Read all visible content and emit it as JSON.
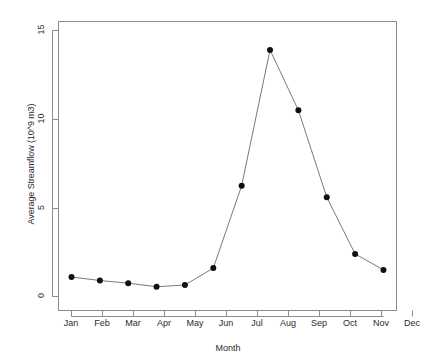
{
  "chart_data": {
    "type": "line",
    "title": "",
    "xlabel": "Month",
    "ylabel": "Average Streamflow (10^9 m3)",
    "categories": [
      "Jan",
      "Feb",
      "Mar",
      "Apr",
      "May",
      "Jun",
      "Jul",
      "Aug",
      "Sep",
      "Oct",
      "Nov",
      "Dec"
    ],
    "values": [
      1.1,
      0.9,
      0.75,
      0.55,
      0.65,
      1.6,
      6.25,
      13.9,
      10.5,
      5.6,
      2.4,
      1.5
    ],
    "series": [
      {
        "name": "Average Streamflow",
        "values": [
          1.1,
          0.9,
          0.75,
          0.55,
          0.65,
          1.6,
          6.25,
          13.9,
          10.5,
          5.6,
          2.4,
          1.5
        ]
      }
    ],
    "yticks": [
      0,
      5,
      10,
      15
    ],
    "ytick_labels": [
      "0",
      "5",
      "10",
      "15"
    ],
    "xtick_labels": [
      "Jan",
      "Feb",
      "Mar",
      "Apr",
      "May",
      "Jun",
      "Jul",
      "Aug",
      "Sep",
      "Oct",
      "Nov",
      "Dec"
    ],
    "ylim": [
      -0.8,
      15.5
    ],
    "grid": false,
    "legend": false,
    "marker": "filled-circle",
    "line_color": "#7a7a7a",
    "marker_color": "#101010",
    "axis_color": "#8c8c8c",
    "background": "#ffffff"
  },
  "axes": {
    "y_title": "Average Streamflow (10^9 m3)",
    "x_title": "Month"
  }
}
